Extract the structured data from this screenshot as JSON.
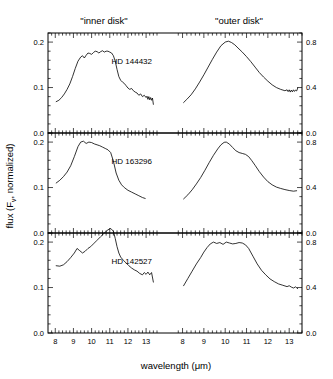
{
  "figure": {
    "column_headers": [
      {
        "id": "inner",
        "label": "\"inner disk\""
      },
      {
        "id": "outer",
        "label": "\"outer disk\""
      }
    ],
    "x_axis_title": "wavelength (μm)",
    "y_axis_title": "flux (F",
    "y_axis_title_sub": "ν",
    "y_axis_title_end": ", normalized)",
    "x_tick_labels": [
      "8",
      "9",
      "10",
      "11",
      "12",
      "13"
    ],
    "y_tick_labels_left": [
      "0.0",
      "0.1",
      "0.2"
    ],
    "y_tick_labels_right": [
      "0.0",
      "0.4",
      "0.8"
    ],
    "stroke_color": "#000000",
    "background_color": "#ffffff"
  },
  "chart_data": {
    "type": "line",
    "title": "",
    "xlabel": "wavelength (μm)",
    "ylabel": "flux (F_nu, normalized)",
    "xlim": [
      7.6,
      13.6
    ],
    "ylim_left": [
      0.0,
      0.22
    ],
    "ylim_right": [
      0.0,
      0.88
    ],
    "grid": false,
    "legend": "none",
    "column_labels": [
      "\"inner disk\"",
      "\"outer disk\""
    ],
    "panels": [
      {
        "row": 0,
        "star": "HD 144432",
        "ytick_left": [
          0.0,
          0.1,
          0.2
        ],
        "ytick_right": [
          0.0,
          0.4,
          0.8
        ],
        "series": [
          {
            "name": "HD 144432 inner disk",
            "column": "inner",
            "x": [
              8.05,
              8.2,
              8.35,
              8.5,
              8.65,
              8.8,
              8.95,
              9.1,
              9.25,
              9.4,
              9.5,
              9.6,
              9.7,
              9.8,
              9.9,
              10.0,
              10.1,
              10.2,
              10.3,
              10.4,
              10.5,
              10.6,
              10.7,
              10.8,
              10.9,
              11.0,
              11.1,
              11.2,
              11.3,
              11.4,
              11.5,
              11.6,
              11.7,
              11.8,
              11.9,
              12.0,
              12.1,
              12.2,
              12.3,
              12.4,
              12.5,
              12.6,
              12.7,
              12.8,
              12.9,
              13.0,
              13.05,
              13.1,
              13.15,
              13.2,
              13.25,
              13.3,
              13.35,
              13.4
            ],
            "y": [
              0.069,
              0.072,
              0.078,
              0.086,
              0.096,
              0.108,
              0.124,
              0.142,
              0.158,
              0.167,
              0.17,
              0.165,
              0.171,
              0.176,
              0.175,
              0.173,
              0.177,
              0.18,
              0.179,
              0.176,
              0.179,
              0.181,
              0.178,
              0.18,
              0.18,
              0.178,
              0.176,
              0.17,
              0.158,
              0.14,
              0.124,
              0.116,
              0.112,
              0.109,
              0.104,
              0.099,
              0.096,
              0.098,
              0.093,
              0.09,
              0.088,
              0.083,
              0.086,
              0.08,
              0.083,
              0.078,
              0.081,
              0.074,
              0.08,
              0.073,
              0.078,
              0.072,
              0.077,
              0.063
            ]
          },
          {
            "name": "HD 144432 outer disk",
            "column": "outer",
            "x": [
              8.05,
              8.2,
              8.4,
              8.6,
              8.8,
              9.0,
              9.2,
              9.4,
              9.6,
              9.8,
              10.0,
              10.15,
              10.3,
              10.45,
              10.6,
              10.8,
              11.0,
              11.2,
              11.4,
              11.6,
              11.8,
              12.0,
              12.2,
              12.4,
              12.6,
              12.8,
              12.9,
              12.95,
              13.0,
              13.05,
              13.1,
              13.15,
              13.2,
              13.25,
              13.3,
              13.35,
              13.4
            ],
            "y": [
              0.268,
              0.296,
              0.336,
              0.388,
              0.448,
              0.512,
              0.58,
              0.648,
              0.712,
              0.768,
              0.8,
              0.808,
              0.796,
              0.776,
              0.748,
              0.712,
              0.672,
              0.628,
              0.58,
              0.532,
              0.492,
              0.456,
              0.424,
              0.4,
              0.384,
              0.372,
              0.38,
              0.364,
              0.38,
              0.36,
              0.378,
              0.362,
              0.38,
              0.366,
              0.378,
              0.37,
              0.396
            ]
          }
        ]
      },
      {
        "row": 1,
        "star": "HD 163296",
        "ytick_left": [
          0.0,
          0.1,
          0.2
        ],
        "ytick_right": [
          0.0,
          0.4,
          0.8
        ],
        "series": [
          {
            "name": "HD 163296 inner disk",
            "column": "inner",
            "x": [
              8.05,
              8.25,
              8.45,
              8.65,
              8.85,
              9.05,
              9.25,
              9.4,
              9.55,
              9.7,
              9.85,
              10.0,
              10.15,
              10.3,
              10.45,
              10.6,
              10.75,
              10.9,
              11.05,
              11.2,
              11.35,
              11.5,
              11.65,
              11.8,
              12.0,
              12.2,
              12.4,
              12.6,
              12.8,
              12.95
            ],
            "y": [
              0.11,
              0.116,
              0.124,
              0.134,
              0.148,
              0.168,
              0.19,
              0.2,
              0.202,
              0.197,
              0.2,
              0.199,
              0.196,
              0.194,
              0.192,
              0.189,
              0.186,
              0.183,
              0.177,
              0.158,
              0.132,
              0.116,
              0.106,
              0.1,
              0.094,
              0.09,
              0.086,
              0.082,
              0.078,
              0.076
            ]
          },
          {
            "name": "HD 163296 outer disk",
            "column": "outer",
            "x": [
              8.05,
              8.25,
              8.45,
              8.65,
              8.85,
              9.05,
              9.25,
              9.45,
              9.65,
              9.8,
              9.95,
              10.05,
              10.2,
              10.35,
              10.5,
              10.65,
              10.8,
              10.95,
              11.1,
              11.25,
              11.4,
              11.6,
              11.8,
              12.0,
              12.2,
              12.4,
              12.6,
              12.8,
              13.0,
              13.2,
              13.35
            ],
            "y": [
              0.3,
              0.336,
              0.38,
              0.432,
              0.488,
              0.552,
              0.62,
              0.684,
              0.74,
              0.776,
              0.798,
              0.8,
              0.782,
              0.752,
              0.724,
              0.708,
              0.7,
              0.692,
              0.672,
              0.636,
              0.596,
              0.54,
              0.492,
              0.452,
              0.424,
              0.404,
              0.392,
              0.382,
              0.374,
              0.368,
              0.372
            ]
          }
        ]
      },
      {
        "row": 2,
        "star": "HD 142527",
        "ytick_left": [
          0.0,
          0.1,
          0.2
        ],
        "ytick_right": [
          0.0,
          0.4,
          0.8
        ],
        "series": [
          {
            "name": "HD 142527 inner disk",
            "column": "inner",
            "x": [
              8.05,
              8.25,
              8.45,
              8.65,
              8.85,
              9.05,
              9.2,
              9.35,
              9.5,
              9.65,
              9.8,
              9.95,
              10.1,
              10.3,
              10.5,
              10.7,
              10.9,
              11.05,
              11.2,
              11.3,
              11.4,
              11.5,
              11.6,
              11.75,
              11.9,
              12.05,
              12.2,
              12.35,
              12.5,
              12.65,
              12.8,
              12.9,
              13.0,
              13.1,
              13.2,
              13.3,
              13.4
            ],
            "y": [
              0.148,
              0.147,
              0.15,
              0.157,
              0.166,
              0.176,
              0.186,
              0.181,
              0.176,
              0.18,
              0.186,
              0.19,
              0.196,
              0.204,
              0.212,
              0.22,
              0.227,
              0.23,
              0.224,
              0.208,
              0.19,
              0.176,
              0.167,
              0.16,
              0.154,
              0.148,
              0.143,
              0.139,
              0.136,
              0.131,
              0.128,
              0.133,
              0.129,
              0.134,
              0.128,
              0.133,
              0.112
            ]
          },
          {
            "name": "HD 142527 outer disk",
            "column": "outer",
            "x": [
              8.05,
              8.25,
              8.45,
              8.65,
              8.85,
              9.0,
              9.15,
              9.3,
              9.45,
              9.6,
              9.75,
              9.9,
              10.05,
              10.2,
              10.35,
              10.5,
              10.65,
              10.8,
              10.95,
              11.1,
              11.3,
              11.5,
              11.7,
              11.9,
              12.1,
              12.3,
              12.5,
              12.7,
              12.9,
              13.0,
              13.1,
              13.2,
              13.3,
              13.4
            ],
            "y": [
              0.416,
              0.48,
              0.544,
              0.608,
              0.664,
              0.712,
              0.752,
              0.784,
              0.8,
              0.788,
              0.796,
              0.78,
              0.8,
              0.792,
              0.784,
              0.788,
              0.796,
              0.792,
              0.776,
              0.744,
              0.676,
              0.608,
              0.552,
              0.512,
              0.476,
              0.452,
              0.432,
              0.42,
              0.408,
              0.416,
              0.404,
              0.396,
              0.406,
              0.39
            ]
          }
        ]
      }
    ]
  }
}
